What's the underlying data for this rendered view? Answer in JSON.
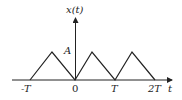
{
  "diagram": {
    "y_axis_label": "x(t)",
    "x_axis_label": "t",
    "amplitude_label": "A",
    "tick_labels": [
      "-T",
      "0",
      "T",
      "2T"
    ],
    "colors": {
      "line": "#222222",
      "background": "#ffffff"
    }
  }
}
